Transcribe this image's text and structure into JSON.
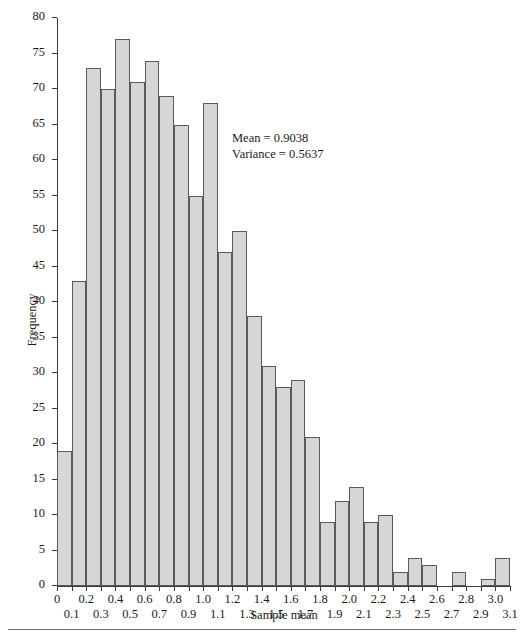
{
  "chart_data": {
    "type": "bar",
    "title": "",
    "xlabel": "Sample mean",
    "ylabel": "Frequency",
    "xlim": [
      0,
      3.1
    ],
    "ylim": [
      0,
      80
    ],
    "grid": false,
    "legend": null,
    "bin_width": 0.1,
    "bin_left_edges": [
      0.0,
      0.1,
      0.2,
      0.3,
      0.4,
      0.5,
      0.6,
      0.7,
      0.8,
      0.9,
      1.0,
      1.1,
      1.2,
      1.3,
      1.4,
      1.5,
      1.6,
      1.7,
      1.8,
      1.9,
      2.0,
      2.1,
      2.2,
      2.3,
      2.4,
      2.5,
      2.6,
      2.7,
      2.8,
      2.9,
      3.0
    ],
    "categories": [
      "0.0-0.1",
      "0.1-0.2",
      "0.2-0.3",
      "0.3-0.4",
      "0.4-0.5",
      "0.5-0.6",
      "0.6-0.7",
      "0.7-0.8",
      "0.8-0.9",
      "0.9-1.0",
      "1.0-1.1",
      "1.1-1.2",
      "1.2-1.3",
      "1.3-1.4",
      "1.4-1.5",
      "1.5-1.6",
      "1.6-1.7",
      "1.7-1.8",
      "1.8-1.9",
      "1.9-2.0",
      "2.0-2.1",
      "2.1-2.2",
      "2.2-2.3",
      "2.3-2.4",
      "2.4-2.5",
      "2.5-2.6",
      "2.6-2.7",
      "2.7-2.8",
      "2.8-2.9",
      "2.9-3.0",
      "3.0-3.1"
    ],
    "values": [
      19,
      43,
      73,
      70,
      77,
      71,
      74,
      69,
      65,
      55,
      68,
      47,
      50,
      38,
      31,
      28,
      29,
      21,
      9,
      12,
      14,
      9,
      10,
      2,
      4,
      3,
      0,
      2,
      0,
      1,
      4
    ],
    "yticks": [
      0,
      5,
      10,
      15,
      20,
      25,
      30,
      35,
      40,
      45,
      50,
      55,
      60,
      65,
      70,
      75,
      80
    ],
    "ytick_labels": [
      "0",
      "5",
      "10",
      "15",
      "20",
      "25",
      "30",
      "35",
      "40",
      "45",
      "50",
      "55",
      "60",
      "65",
      "70",
      "75",
      "80"
    ],
    "xticks": [
      0.0,
      0.1,
      0.2,
      0.3,
      0.4,
      0.5,
      0.6,
      0.7,
      0.8,
      0.9,
      1.0,
      1.1,
      1.2,
      1.3,
      1.4,
      1.5,
      1.6,
      1.7,
      1.8,
      1.9,
      2.0,
      2.1,
      2.2,
      2.3,
      2.4,
      2.5,
      2.6,
      2.7,
      2.8,
      2.9,
      3.0,
      3.1
    ],
    "xtick_labels": [
      "0",
      "0.1",
      "0.2",
      "0.3",
      "0.4",
      "0.5",
      "0.6",
      "0.7",
      "0.8",
      "0.9",
      "1.0",
      "1.1",
      "1.2",
      "1.3",
      "1.4",
      "1.5",
      "1.6",
      "1.7",
      "1.8",
      "1.9",
      "2.0",
      "2.1",
      "2.2",
      "2.3",
      "2.4",
      "2.5",
      "2.6",
      "2.7",
      "2.8",
      "2.9",
      "3.0",
      "3.1"
    ],
    "annotations": [
      {
        "text": "Mean = 0.9038"
      },
      {
        "text": "Variance = 0.5637"
      }
    ],
    "colors": {
      "bar_fill": "#d6d6d6",
      "bar_edge": "#5a5a5a",
      "axis": "#3a3a3a",
      "text": "#1b1b1b",
      "background": "#ffffff",
      "rule": "#6e6e6e"
    }
  }
}
